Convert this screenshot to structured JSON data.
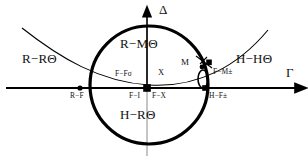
{
  "figure": {
    "kind": "phase-classification-diagram",
    "background_color": "#ffffff",
    "line_color": "#000000"
  },
  "axes": {
    "horizontal": {
      "name": "gamma-axis",
      "label": "Γ",
      "label_x": 286,
      "label_y": 72,
      "y": 88,
      "x_start": 6,
      "x_end": 300
    },
    "vertical": {
      "name": "delta-axis",
      "label": "Δ",
      "label_x": 158,
      "label_y": 5,
      "x": 147,
      "y_start": 156,
      "y_end": 10
    }
  },
  "curves": {
    "circle": {
      "name": "unit-circle",
      "cx": 149,
      "cy": 85,
      "r": 59,
      "stroke_width": 3.2
    },
    "parabola": {
      "name": "discriminant-parabola",
      "path": "M 22 28 C 60 58, 100 82, 149 85 C 198 88, 238 66, 268 30",
      "stroke_width": 1.1
    },
    "small_ellipse": {
      "name": "m-point-ellipse",
      "cx": 203,
      "cy": 79,
      "rx": 5,
      "ry": 9,
      "stroke_width": 1.6
    }
  },
  "regions": [
    {
      "id": "r-r-theta",
      "label": "R−RΘ",
      "x": 22,
      "y": 57,
      "align": "left"
    },
    {
      "id": "r-m-theta",
      "label": "R−MΘ",
      "x": 121,
      "y": 42,
      "align": "left"
    },
    {
      "id": "h-r-theta",
      "label": "H−RΘ",
      "x": 121,
      "y": 112,
      "align": "left"
    },
    {
      "id": "h-h-theta",
      "label": "H−HΘ",
      "x": 236,
      "y": 57,
      "align": "left"
    }
  ],
  "points": [
    {
      "id": "r-f",
      "marker": "dot",
      "label": "R−F",
      "cx": 80,
      "cy": 88,
      "r": 2.6,
      "label_x": 68,
      "label_y": 93,
      "size": "small"
    },
    {
      "id": "f-i",
      "marker": "square",
      "label": "F−I",
      "cx": 147,
      "cy": 88,
      "w": 7.5,
      "h": 7.5,
      "label_x": 128,
      "label_y": 93,
      "size": "small"
    },
    {
      "id": "f-f-sigma",
      "marker": "none",
      "label": "F−Fσ",
      "label_x": 117,
      "label_y": 72,
      "size": "small"
    },
    {
      "id": "x-point",
      "marker": "none",
      "label": "X",
      "label_x": 158,
      "label_y": 71,
      "size": "mid"
    },
    {
      "id": "f-x",
      "marker": "none",
      "label": "F−X",
      "label_x": 153,
      "label_y": 93,
      "size": "small"
    },
    {
      "id": "m-point",
      "marker": "dot",
      "label": "M",
      "cx": 202,
      "cy": 68,
      "r": 2.4,
      "label_x": 182,
      "label_y": 63,
      "size": "M"
    },
    {
      "id": "f-m-pm",
      "marker": "square",
      "label": "F−M±",
      "cx": 209,
      "cy": 63,
      "w": 5.5,
      "h": 5.5,
      "label_x": 213,
      "label_y": 71,
      "size": "small"
    },
    {
      "id": "h-f-pm",
      "marker": "square",
      "label": "H−F±",
      "cx": 205,
      "cy": 88,
      "w": 5.5,
      "h": 5.5,
      "label_x": 209,
      "label_y": 93,
      "size": "small"
    }
  ],
  "connector": {
    "name": "m-to-fm-tick",
    "path": "M 198 57 L 213 69"
  }
}
